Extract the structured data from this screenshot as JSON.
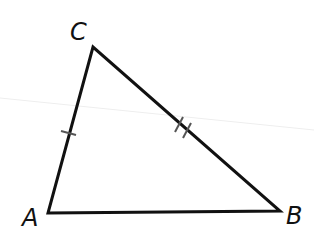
{
  "diagram": {
    "type": "triangle",
    "vertices": {
      "A": {
        "label": "A",
        "x": 48,
        "y": 213
      },
      "B": {
        "label": "B",
        "x": 280,
        "y": 211
      },
      "C": {
        "label": "C",
        "x": 93,
        "y": 47
      }
    },
    "sides": [
      {
        "name": "AC",
        "tick_marks": 1
      },
      {
        "name": "CB",
        "tick_marks": 2
      },
      {
        "name": "AB",
        "tick_marks": 0
      }
    ],
    "colors": {
      "stroke": "#111111",
      "tick": "#555555",
      "background": "#ffffff"
    }
  }
}
